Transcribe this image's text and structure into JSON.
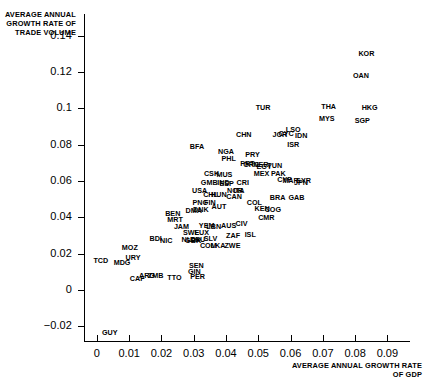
{
  "chart_data": {
    "type": "scatter",
    "title": "",
    "xlabel": "AVERAGE ANNUAL GROWTH RATE OF GDP",
    "ylabel": "AVERAGE ANNUAL GROWTH RATE OF TRADE VOLUME",
    "xlim": [
      -0.004,
      0.097
    ],
    "ylim": [
      -0.028,
      0.152
    ],
    "grid": false,
    "legend": null,
    "marker_style": "text-label-only",
    "xticks": [
      0,
      0.01,
      0.02,
      0.03,
      0.04,
      0.05,
      0.06,
      0.07,
      0.08,
      0.09
    ],
    "xtick_labels": [
      "0",
      "0.01",
      "0.02",
      "0.03",
      "0.04",
      "0.05",
      "0.06",
      "0.07",
      "0.08",
      "0.09"
    ],
    "yticks": [
      -0.02,
      0,
      0.02,
      0.04,
      0.06,
      0.08,
      0.1,
      0.12,
      0.14
    ],
    "ytick_labels": [
      "−0.02",
      "0",
      "0.02",
      "0.04",
      "0.06",
      "0.08",
      "0.1",
      "0.12",
      "0.14"
    ],
    "points": [
      {
        "label": "KOR",
        "x": 0.0835,
        "y": 0.13
      },
      {
        "label": "OAN",
        "x": 0.0818,
        "y": 0.118
      },
      {
        "label": "HKG",
        "x": 0.0845,
        "y": 0.1005
      },
      {
        "label": "SGP",
        "x": 0.0822,
        "y": 0.093
      },
      {
        "label": "THA",
        "x": 0.0718,
        "y": 0.101
      },
      {
        "label": "MYS",
        "x": 0.0712,
        "y": 0.094
      },
      {
        "label": "TUR",
        "x": 0.0515,
        "y": 0.1
      },
      {
        "label": "LSO",
        "x": 0.0608,
        "y": 0.088
      },
      {
        "label": "IDN",
        "x": 0.0633,
        "y": 0.085
      },
      {
        "label": "JOR",
        "x": 0.0567,
        "y": 0.0855
      },
      {
        "label": "CYC",
        "x": 0.0586,
        "y": 0.0858
      },
      {
        "label": "ISR",
        "x": 0.0608,
        "y": 0.08
      },
      {
        "label": "CHN",
        "x": 0.0455,
        "y": 0.0855
      },
      {
        "label": "BFA",
        "x": 0.031,
        "y": 0.079
      },
      {
        "label": "NGA",
        "x": 0.04,
        "y": 0.076
      },
      {
        "label": "PHL",
        "x": 0.0408,
        "y": 0.072
      },
      {
        "label": "PRY",
        "x": 0.0482,
        "y": 0.0745
      },
      {
        "label": "GRC",
        "x": 0.0478,
        "y": 0.069
      },
      {
        "label": "PRT",
        "x": 0.0466,
        "y": 0.0692
      },
      {
        "label": "EGY",
        "x": 0.0518,
        "y": 0.068
      },
      {
        "label": "NER",
        "x": 0.0508,
        "y": 0.0688
      },
      {
        "label": "TUN",
        "x": 0.0551,
        "y": 0.0682
      },
      {
        "label": "MEX",
        "x": 0.051,
        "y": 0.064
      },
      {
        "label": "PAK",
        "x": 0.0562,
        "y": 0.0638
      },
      {
        "label": "CSK",
        "x": 0.0355,
        "y": 0.0638
      },
      {
        "label": "MUS",
        "x": 0.0395,
        "y": 0.0632
      },
      {
        "label": "CYP",
        "x": 0.0582,
        "y": 0.0605
      },
      {
        "label": "MAR",
        "x": 0.06,
        "y": 0.06
      },
      {
        "label": "SYR",
        "x": 0.064,
        "y": 0.0598
      },
      {
        "label": "JPN",
        "x": 0.0632,
        "y": 0.0592
      },
      {
        "label": "GMB",
        "x": 0.0348,
        "y": 0.0592
      },
      {
        "label": "IND",
        "x": 0.0392,
        "y": 0.0588
      },
      {
        "label": "ESP",
        "x": 0.0402,
        "y": 0.0585
      },
      {
        "label": "CRI",
        "x": 0.0452,
        "y": 0.0592
      },
      {
        "label": "ITA",
        "x": 0.044,
        "y": 0.0548
      },
      {
        "label": "NOR",
        "x": 0.0428,
        "y": 0.0545
      },
      {
        "label": "USA",
        "x": 0.0318,
        "y": 0.0545
      },
      {
        "label": "CHL",
        "x": 0.0352,
        "y": 0.0522
      },
      {
        "label": "HUN",
        "x": 0.0378,
        "y": 0.0525
      },
      {
        "label": "CAN",
        "x": 0.0425,
        "y": 0.0512
      },
      {
        "label": "BRA",
        "x": 0.056,
        "y": 0.0508
      },
      {
        "label": "GAB",
        "x": 0.0618,
        "y": 0.0508
      },
      {
        "label": "COL",
        "x": 0.0488,
        "y": 0.048
      },
      {
        "label": "PNG",
        "x": 0.032,
        "y": 0.0478
      },
      {
        "label": "FIN",
        "x": 0.035,
        "y": 0.0482
      },
      {
        "label": "AUT",
        "x": 0.0378,
        "y": 0.046
      },
      {
        "label": "DNK",
        "x": 0.0322,
        "y": 0.044
      },
      {
        "label": "DMA",
        "x": 0.03,
        "y": 0.0438
      },
      {
        "label": "KEN",
        "x": 0.0512,
        "y": 0.0448
      },
      {
        "label": "COG",
        "x": 0.0545,
        "y": 0.044
      },
      {
        "label": "BEN",
        "x": 0.0235,
        "y": 0.0418
      },
      {
        "label": "MRT",
        "x": 0.0242,
        "y": 0.0388
      },
      {
        "label": "CMR",
        "x": 0.0525,
        "y": 0.0395
      },
      {
        "label": "JAM",
        "x": 0.0262,
        "y": 0.0348
      },
      {
        "label": "YEM",
        "x": 0.034,
        "y": 0.0352
      },
      {
        "label": "LBN",
        "x": 0.0362,
        "y": 0.0348
      },
      {
        "label": "AUS",
        "x": 0.0408,
        "y": 0.0352
      },
      {
        "label": "CIV",
        "x": 0.0448,
        "y": 0.0362
      },
      {
        "label": "SWE",
        "x": 0.0292,
        "y": 0.0315
      },
      {
        "label": "LUX",
        "x": 0.0325,
        "y": 0.0312
      },
      {
        "label": "ZAF",
        "x": 0.0422,
        "y": 0.03
      },
      {
        "label": "ISL",
        "x": 0.0475,
        "y": 0.0305
      },
      {
        "label": "NLD",
        "x": 0.0285,
        "y": 0.0275
      },
      {
        "label": "DEU",
        "x": 0.0312,
        "y": 0.0278
      },
      {
        "label": "SLV",
        "x": 0.0352,
        "y": 0.0282
      },
      {
        "label": "GBR",
        "x": 0.0298,
        "y": 0.0268
      },
      {
        "label": "COM",
        "x": 0.0345,
        "y": 0.0242
      },
      {
        "label": "LKA",
        "x": 0.0375,
        "y": 0.0242
      },
      {
        "label": "ZWE",
        "x": 0.042,
        "y": 0.0245
      },
      {
        "label": "BDI",
        "x": 0.0182,
        "y": 0.0282
      },
      {
        "label": "NIC",
        "x": 0.0215,
        "y": 0.0268
      },
      {
        "label": "MOZ",
        "x": 0.0102,
        "y": 0.0232
      },
      {
        "label": "URY",
        "x": 0.0112,
        "y": 0.0178
      },
      {
        "label": "MDG",
        "x": 0.0078,
        "y": 0.0152
      },
      {
        "label": "TCD",
        "x": 0.0012,
        "y": 0.0162
      },
      {
        "label": "SEN",
        "x": 0.0308,
        "y": 0.0135
      },
      {
        "label": "GIN",
        "x": 0.0302,
        "y": 0.0098
      },
      {
        "label": "PER",
        "x": 0.0312,
        "y": 0.0075
      },
      {
        "label": "CAF",
        "x": 0.0125,
        "y": 0.0062
      },
      {
        "label": "ARG",
        "x": 0.0155,
        "y": 0.0078
      },
      {
        "label": "ZMB",
        "x": 0.0182,
        "y": 0.0078
      },
      {
        "label": "TTO",
        "x": 0.024,
        "y": 0.0068
      },
      {
        "label": "GUY",
        "x": 0.004,
        "y": -0.0235
      }
    ]
  },
  "axes": {
    "y_title": "AVERAGE ANNUAL GROWTH RATE OF TRADE VOLUME",
    "x_title": "AVERAGE ANNUAL GROWTH RATE OF GDP"
  }
}
